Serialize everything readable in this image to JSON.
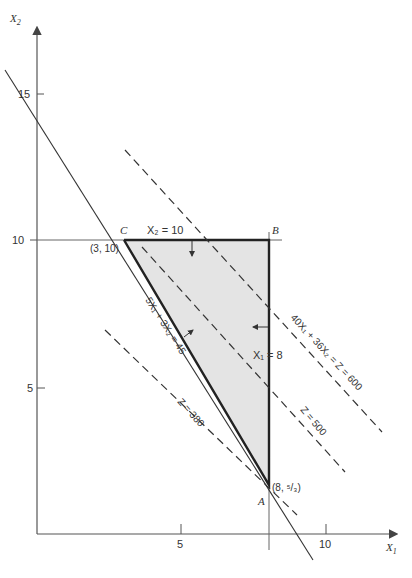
{
  "figure": {
    "type": "linear-programming-graphical-solution",
    "axes": {
      "x_label": "X",
      "x_sub": "1",
      "y_label": "X",
      "y_sub": "2",
      "x_ticks": [
        "5",
        "10"
      ],
      "y_ticks": [
        "5",
        "10",
        "15"
      ]
    },
    "vertices": {
      "A": {
        "label": "A",
        "coord": "(8, ⁵/₃)"
      },
      "B": {
        "label": "B"
      },
      "C": {
        "label": "C",
        "coord": "(3, 10)"
      }
    },
    "constraints": {
      "x2_eq_10": "X₂ = 10",
      "x1_eq_8": "X₁ = 8",
      "line_5x1_3x2": "5X₁ + 3X₂ = 45"
    },
    "objective_lines": {
      "z600": "40X₁ + 36X₂ = Z = 600",
      "z500": "Z = 500",
      "z380": "Z = 380"
    },
    "colors": {
      "feasible_region": "#e4e4e4",
      "lines": "#222222",
      "axis": "#555555"
    }
  }
}
